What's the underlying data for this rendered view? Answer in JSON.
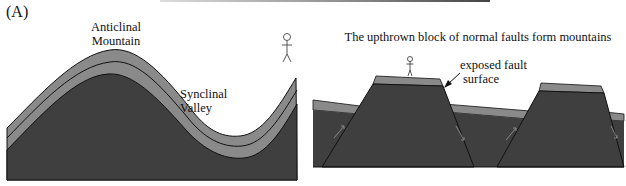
{
  "figure": {
    "panel_label": "(A)",
    "left_diagram": {
      "title": "Folded rock layers",
      "labels": {
        "anticline_line1": "Anticlinal",
        "anticline_line2": "Mountain",
        "syncline_line1": "Synclinal",
        "syncline_line2": "Valley"
      }
    },
    "right_diagram": {
      "caption": "The upthrown block of normal faults form mountains",
      "labels": {
        "fault_line1": "exposed fault",
        "fault_line2": "surface"
      }
    },
    "colors": {
      "bedrock": "#3f3f3f",
      "layer": "#8a8a8a",
      "outline": "#111111",
      "background": "#ffffff"
    }
  }
}
